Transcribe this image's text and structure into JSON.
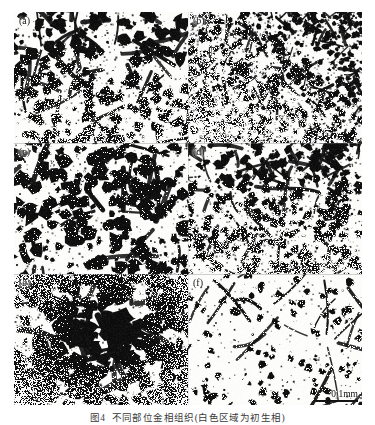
{
  "figure": {
    "caption_number": "图4",
    "caption_text": "不同部位金相组织(白色区域为初生相)",
    "scale_label": "0.1mm",
    "background_color": "#ffffff",
    "ink_color": "#101010"
  },
  "panels": [
    {
      "id": "a",
      "label": "(a)",
      "density": 0.3,
      "seed": 1207,
      "blob_count": 430,
      "blob_size": [
        1.6,
        6.2
      ],
      "network_scale": 34,
      "thickness": 3.0,
      "speckle": 0.22,
      "description": "moderate dendritic network, medium-coarse cells"
    },
    {
      "id": "b",
      "label": "(b)",
      "density": 0.46,
      "seed": 5533,
      "blob_count": 1150,
      "blob_size": [
        0.9,
        3.4
      ],
      "network_scale": 18,
      "thickness": 2.2,
      "speckle": 0.55,
      "description": "very fine dense speckled network, heaviest upper-right"
    },
    {
      "id": "c",
      "label": "(c)",
      "density": 0.34,
      "seed": 8821,
      "blob_count": 400,
      "blob_size": [
        2.0,
        7.0
      ],
      "network_scale": 40,
      "thickness": 3.6,
      "speckle": 0.2,
      "description": "coarse thick-walled cell boundaries, large cells"
    },
    {
      "id": "d",
      "label": "(d)",
      "density": 0.33,
      "seed": 3109,
      "blob_count": 700,
      "blob_size": [
        1.2,
        4.6
      ],
      "network_scale": 25,
      "thickness": 2.6,
      "speckle": 0.34,
      "description": "medium-fine network, fairly uniform"
    },
    {
      "id": "e",
      "label": "(e)",
      "density": 0.4,
      "seed": 6447,
      "blob_count": 520,
      "blob_size": [
        2.4,
        9.5
      ],
      "network_scale": 30,
      "thickness": 4.4,
      "speckle": 0.26,
      "description": "heavy dark agglomerated blobs, darkest panel"
    },
    {
      "id": "f",
      "label": "(f)",
      "density": 0.17,
      "seed": 9912,
      "blob_count": 230,
      "blob_size": [
        1.2,
        4.0
      ],
      "network_scale": 42,
      "thickness": 2.4,
      "speckle": 0.1,
      "description": "sparse thin network, lightest panel, carries scale bar"
    }
  ]
}
